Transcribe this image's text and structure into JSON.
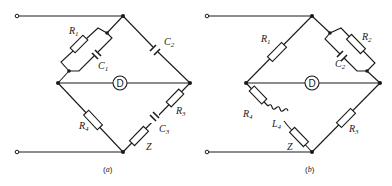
{
  "figure": {
    "panel_a": {
      "caption_open": "(",
      "caption_letter": "a",
      "caption_close": ")",
      "detector_label": "D",
      "components": {
        "R1": {
          "letter": "R",
          "sub": "1"
        },
        "C1": {
          "letter": "C",
          "sub": "1"
        },
        "C2": {
          "letter": "C",
          "sub": "2"
        },
        "R3": {
          "letter": "R",
          "sub": "3"
        },
        "C3": {
          "letter": "C",
          "sub": "3"
        },
        "R4": {
          "letter": "R",
          "sub": "4"
        },
        "Z": {
          "letter": "Z"
        }
      }
    },
    "panel_b": {
      "caption_open": "(",
      "caption_letter": "b",
      "caption_close": ")",
      "detector_label": "D",
      "components": {
        "R1": {
          "letter": "R",
          "sub": "1"
        },
        "R2": {
          "letter": "R",
          "sub": "2"
        },
        "C2": {
          "letter": "C",
          "sub": "2"
        },
        "R3": {
          "letter": "R",
          "sub": "3"
        },
        "R4": {
          "letter": "R",
          "sub": "4"
        },
        "L4": {
          "letter": "L",
          "sub": "4"
        },
        "Z": {
          "letter": "Z"
        }
      }
    }
  }
}
